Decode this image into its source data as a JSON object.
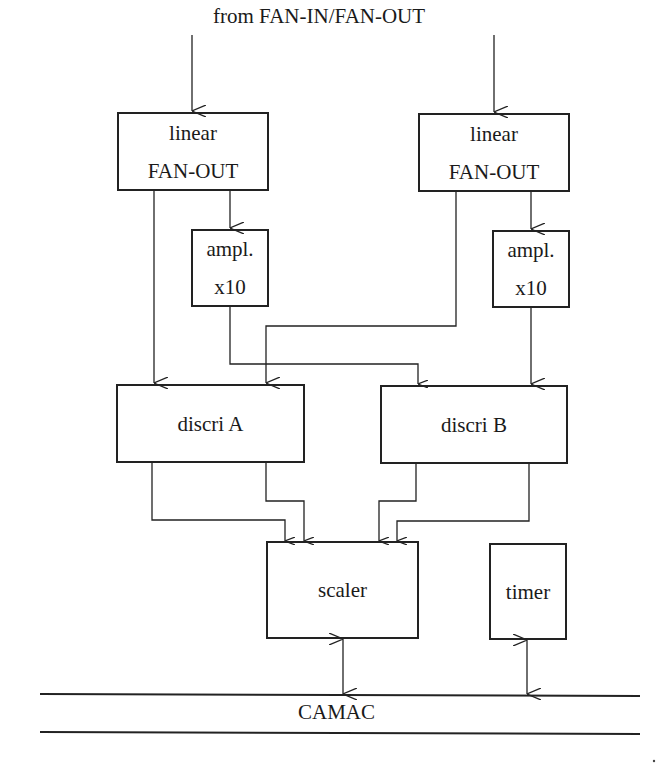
{
  "diagram": {
    "input_label": "from FAN-IN/FAN-OUT",
    "fanout_left": {
      "line1": "linear",
      "line2": "FAN-OUT"
    },
    "fanout_right": {
      "line1": "linear",
      "line2": "FAN-OUT"
    },
    "amp_left": {
      "line1": "ampl.",
      "line2": "x10"
    },
    "amp_right": {
      "line1": "ampl.",
      "line2": "x10"
    },
    "discri_a": "discri A",
    "discri_b": "discri B",
    "scaler": "scaler",
    "timer": "timer",
    "bus": "CAMAC"
  },
  "colors": {
    "line": "#222222",
    "background": "#ffffff"
  }
}
